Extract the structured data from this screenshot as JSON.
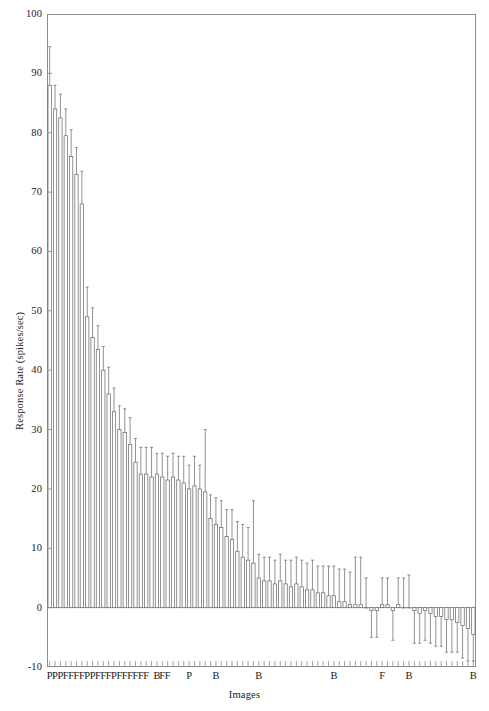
{
  "chart_data": {
    "type": "bar",
    "title": "",
    "subtitle": "",
    "xlabel": "Images",
    "ylabel": "Response Rate (spikes/sec)",
    "ylim": [
      -10,
      100
    ],
    "yticks": [
      -10,
      0,
      10,
      20,
      30,
      40,
      50,
      60,
      70,
      80,
      90,
      100
    ],
    "ytick_labels": [
      "-10",
      "0",
      "10",
      "20",
      "30",
      "40",
      "50",
      "60",
      "70",
      "80",
      "90",
      "100"
    ],
    "grid": false,
    "legend": null,
    "error_bars": "symmetric standard error, drawn as vertical whiskers with end caps",
    "n_bars": 80,
    "bar_fill": "#ffffff",
    "bar_edge": "#6e6e6e",
    "error_color": "#6e6e6e",
    "axis_color": "#8d8d8d",
    "xtick_count": 80,
    "xtick_labels_sparse": [
      {
        "index": 0,
        "label": "P"
      },
      {
        "index": 1,
        "label": "P"
      },
      {
        "index": 2,
        "label": "P"
      },
      {
        "index": 3,
        "label": "F"
      },
      {
        "index": 4,
        "label": "F"
      },
      {
        "index": 5,
        "label": "F"
      },
      {
        "index": 6,
        "label": "F"
      },
      {
        "index": 7,
        "label": "P"
      },
      {
        "index": 8,
        "label": "P"
      },
      {
        "index": 9,
        "label": "F"
      },
      {
        "index": 10,
        "label": "F"
      },
      {
        "index": 11,
        "label": "F"
      },
      {
        "index": 12,
        "label": "P"
      },
      {
        "index": 13,
        "label": "F"
      },
      {
        "index": 14,
        "label": "F"
      },
      {
        "index": 15,
        "label": "F"
      },
      {
        "index": 16,
        "label": "F"
      },
      {
        "index": 17,
        "label": "F"
      },
      {
        "index": 18,
        "label": "F"
      },
      {
        "index": 20,
        "label": "B"
      },
      {
        "index": 21,
        "label": "F"
      },
      {
        "index": 22,
        "label": "F"
      },
      {
        "index": 26,
        "label": "P"
      },
      {
        "index": 31,
        "label": "B"
      },
      {
        "index": 39,
        "label": "B"
      },
      {
        "index": 53,
        "label": "B"
      },
      {
        "index": 62,
        "label": "F"
      },
      {
        "index": 67,
        "label": "B"
      },
      {
        "index": 79,
        "label": "B"
      }
    ],
    "values": [
      88.0,
      84.0,
      82.5,
      79.5,
      76.0,
      73.0,
      68.0,
      49.0,
      45.5,
      43.5,
      40.0,
      36.0,
      33.0,
      30.0,
      29.5,
      27.5,
      24.5,
      22.5,
      22.5,
      22.0,
      22.5,
      22.0,
      21.5,
      22.0,
      21.5,
      21.0,
      20.0,
      20.5,
      20.0,
      19.5,
      15.0,
      14.0,
      13.5,
      12.0,
      11.5,
      9.5,
      8.5,
      8.0,
      7.5,
      5.0,
      4.5,
      4.5,
      4.0,
      4.5,
      4.0,
      3.5,
      4.0,
      3.5,
      3.0,
      3.0,
      2.5,
      2.5,
      2.0,
      2.0,
      1.0,
      1.0,
      0.5,
      0.5,
      0.5,
      0.0,
      -0.5,
      -0.5,
      0.5,
      0.5,
      -0.5,
      0.5,
      0.0,
      0.0,
      -0.5,
      -1.0,
      -0.5,
      -1.0,
      -1.5,
      -1.5,
      -2.0,
      -2.0,
      -2.5,
      -3.0,
      -3.5,
      -4.5
    ],
    "errors": [
      6.5,
      4.0,
      4.0,
      4.5,
      4.5,
      4.5,
      5.5,
      5.0,
      5.0,
      4.0,
      4.0,
      4.5,
      4.0,
      4.0,
      4.0,
      4.5,
      4.0,
      4.5,
      4.5,
      5.0,
      3.5,
      4.0,
      4.0,
      4.0,
      4.0,
      4.5,
      4.0,
      5.0,
      4.0,
      10.5,
      4.0,
      4.5,
      4.5,
      4.5,
      5.0,
      5.0,
      5.5,
      5.5,
      10.5,
      4.0,
      4.0,
      4.0,
      4.0,
      4.5,
      4.0,
      4.5,
      4.5,
      4.5,
      4.5,
      5.0,
      4.5,
      4.5,
      5.0,
      5.0,
      5.5,
      5.5,
      5.5,
      8.0,
      8.0,
      5.0,
      4.5,
      4.5,
      4.5,
      4.5,
      5.0,
      4.5,
      5.0,
      5.5,
      5.5,
      5.0,
      5.0,
      5.0,
      5.0,
      5.0,
      5.5,
      5.5,
      5.0,
      5.5,
      5.5,
      4.5
    ]
  }
}
